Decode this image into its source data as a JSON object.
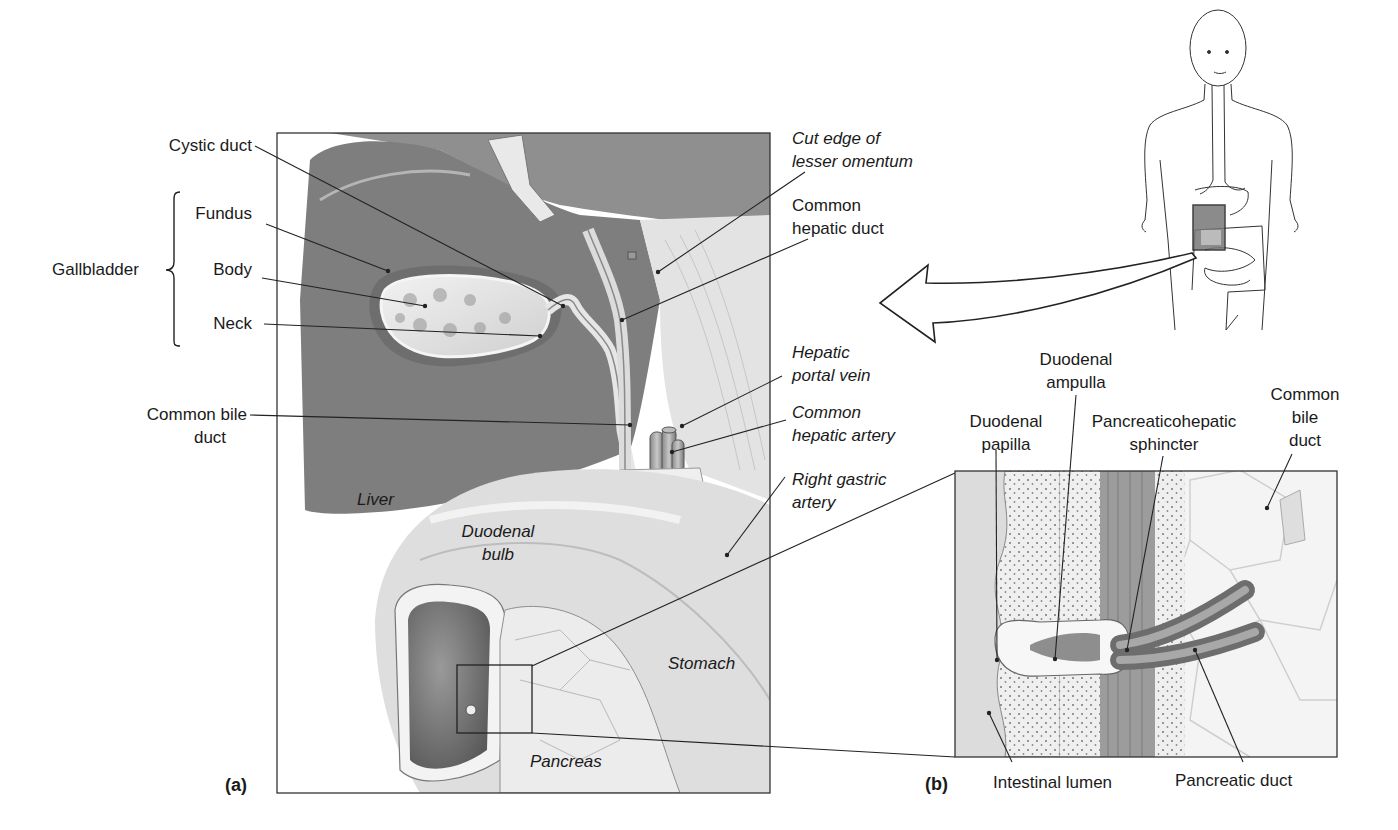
{
  "figure": {
    "panel_a_tag": "(a)",
    "panel_b_tag": "(b)",
    "group_label": "Gallbladder",
    "colors": {
      "ink": "#1a1a1a",
      "liver": "#8a8a8a",
      "liver_dark": "#6f6f6f",
      "light_tissue": "#d9d9d9",
      "background": "#ffffff"
    }
  },
  "panel_a": {
    "left_labels": {
      "cystic_duct": "Cystic duct",
      "fundus": "Fundus",
      "body": "Body",
      "neck": "Neck",
      "common_bile_duct_1": "Common bile",
      "common_bile_duct_2": "duct"
    },
    "right_labels": {
      "cut_edge_1": "Cut edge of",
      "cut_edge_2": "lesser omentum",
      "common_hepatic_duct_1": "Common",
      "common_hepatic_duct_2": "hepatic duct",
      "hepatic_portal_vein_1": "Hepatic",
      "hepatic_portal_vein_2": "portal vein",
      "common_hepatic_artery_1": "Common",
      "common_hepatic_artery_2": "hepatic artery",
      "right_gastric_artery_1": "Right gastric",
      "right_gastric_artery_2": "artery"
    },
    "inner_labels": {
      "liver": "Liver",
      "duodenal_bulb_1": "Duodenal",
      "duodenal_bulb_2": "bulb",
      "stomach": "Stomach",
      "pancreas": "Pancreas"
    }
  },
  "panel_b": {
    "top_labels": {
      "duodenal_ampulla_1": "Duodenal",
      "duodenal_ampulla_2": "ampulla",
      "duodenal_papilla_1": "Duodenal",
      "duodenal_papilla_2": "papilla",
      "pancreaticohepatic_sphincter_1": "Pancreaticohepatic",
      "pancreaticohepatic_sphincter_2": "sphincter",
      "common_bile_duct_1": "Common",
      "common_bile_duct_2": "bile",
      "common_bile_duct_3": "duct"
    },
    "bottom_labels": {
      "intestinal_lumen": "Intestinal lumen",
      "pancreatic_duct": "Pancreatic duct"
    }
  }
}
